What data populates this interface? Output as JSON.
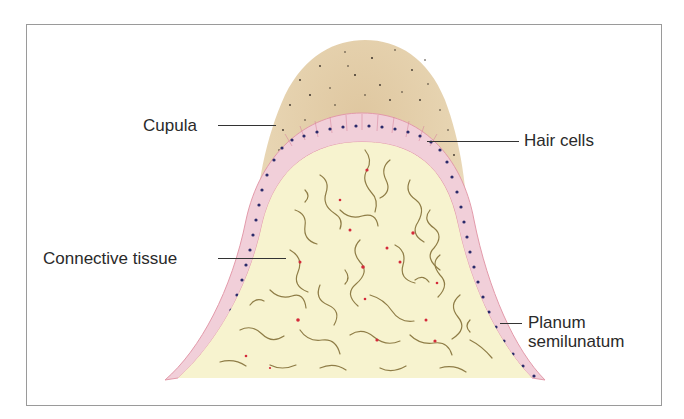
{
  "figure": {
    "type": "anatomical cross-section diagram",
    "labels": {
      "cupula": "Cupula",
      "hair_cells": "Hair cells",
      "connective_tissue": "Connective tissue",
      "planum_line1": "Planum",
      "planum_line2": "semilunatum"
    },
    "colors": {
      "cupula_fill": "#e6d0a8",
      "epithelium_fill": "#f1cfd9",
      "epithelium_edge": "#e39aaa",
      "nuclei": "#2a2a6a",
      "connective_fill": "#f7f3cf",
      "fibers": "#8f7d47",
      "red_cells": "#d42a3a",
      "frame_border": "#9a9a9a",
      "leader_lines": "#333333"
    }
  }
}
